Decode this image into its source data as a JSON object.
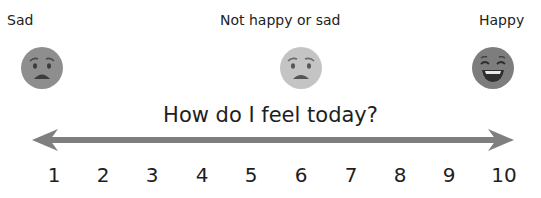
{
  "labels": {
    "left": "Sad",
    "middle": "Not happy or sad",
    "right": "Happy"
  },
  "faces": [
    {
      "mood": "sad",
      "color": "#8e8e8e"
    },
    {
      "mood": "neutral",
      "color": "#c4c4c4"
    },
    {
      "mood": "happy",
      "color": "#7d7d7d"
    }
  ],
  "title": "How do I feel today?",
  "scale": [
    "1",
    "2",
    "3",
    "4",
    "5",
    "6",
    "7",
    "8",
    "9",
    "10"
  ],
  "colors": {
    "arrow": "#7f7f7f",
    "text": "#1e1e1e"
  }
}
